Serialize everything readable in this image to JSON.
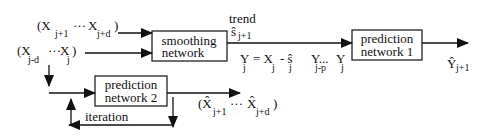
{
  "diagram": {
    "boxes": {
      "smoothing": {
        "line1": "smoothing",
        "line2": "network"
      },
      "prediction1": {
        "line1": "prediction",
        "line2": "network  1"
      },
      "prediction2": {
        "line1": "prediction",
        "line2": "network  2"
      }
    },
    "labels": {
      "future_inputs": {
        "open": "(X",
        "sub1": "j+1",
        "dots": "···",
        "x2": "X",
        "sub2": "j+d",
        "close": ")"
      },
      "past_inputs": {
        "open": "(X",
        "sub1": "j-d",
        "dots": "···",
        "x2": "X",
        "sub2": "j",
        "close": ")"
      },
      "trend": "trend",
      "trend_value": {
        "sym": "ŝ",
        "sub": "j+1"
      },
      "residual_eq": {
        "y": "Y",
        "ysub": "j",
        "eq": "= X",
        "xsub": "j",
        "minus": "- ŝ",
        "ssub": "j"
      },
      "window": {
        "y1": "Y...",
        "y1sub": "j-p",
        "y2": "Y",
        "y2sub": "j"
      },
      "output": {
        "sym": "Ŷ",
        "sub": "j+1"
      },
      "pred_outputs": {
        "open": "(X̂",
        "sub1": "j+1",
        "dots": "···",
        "x2": "X̂",
        "sub2": "j+d",
        "close": ")"
      },
      "iteration": "iteration"
    }
  }
}
